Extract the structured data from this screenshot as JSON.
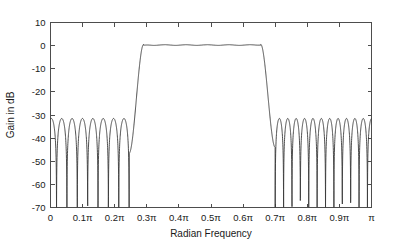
{
  "figure": {
    "background_color": "#ffffff",
    "axes_color": "#4d4d4d",
    "line_color": "#3a3a3a"
  },
  "chart_data": {
    "type": "line",
    "title": "",
    "subtitle": "",
    "xlabel": "Radian Frequency",
    "ylabel": "Gain in dB",
    "xlim": [
      0,
      1
    ],
    "ylim": [
      -70,
      10
    ],
    "grid": false,
    "legend": null,
    "annotations": [],
    "xtick_values": [
      0,
      0.1,
      0.2,
      0.3,
      0.4,
      0.5,
      0.6,
      0.7,
      0.8,
      0.9,
      1
    ],
    "xtick_labels": [
      "0",
      "0.1π",
      "0.2π",
      "0.3π",
      "0.4π",
      "0.5π",
      "0.6π",
      "0.7π",
      "0.8π",
      "0.9π",
      "π"
    ],
    "ytick_values": [
      10,
      0,
      -10,
      -20,
      -30,
      -40,
      -50,
      -60,
      -70
    ],
    "ytick_labels": [
      "10",
      "0",
      "-10",
      "-20",
      "-30",
      "-40",
      "-50",
      "-60",
      "-70"
    ],
    "series": [
      {
        "name": "Magnitude response",
        "description": "Equiripple bandpass FIR filter magnitude response in dB",
        "filter": {
          "type": "bandpass",
          "passband_edges_pi": [
            0.29,
            0.655
          ],
          "stopband_edges_pi": [
            0.245,
            0.7
          ],
          "passband_ripple_db": 0.6,
          "stopband_attenuation_db": -31.5,
          "transition_width_pi": 0.045,
          "left_stopband_lobe_count": 8,
          "right_stopband_lobe_count": 12
        },
        "key_points": [
          {
            "x_pi": 0.0,
            "y_db": -31.8
          },
          {
            "x_pi": 0.017,
            "y_db": -62.5
          },
          {
            "x_pi": 0.04,
            "y_db": -32.5
          },
          {
            "x_pi": 0.062,
            "y_db": -60.0
          },
          {
            "x_pi": 0.085,
            "y_db": -32.2
          },
          {
            "x_pi": 0.108,
            "y_db": -53.0
          },
          {
            "x_pi": 0.13,
            "y_db": -32.0
          },
          {
            "x_pi": 0.152,
            "y_db": -61.5
          },
          {
            "x_pi": 0.175,
            "y_db": -31.9
          },
          {
            "x_pi": 0.198,
            "y_db": -62.0
          },
          {
            "x_pi": 0.218,
            "y_db": -31.8
          },
          {
            "x_pi": 0.236,
            "y_db": -70.0
          },
          {
            "x_pi": 0.245,
            "y_db": -46.5
          },
          {
            "x_pi": 0.29,
            "y_db": 0.5
          },
          {
            "x_pi": 0.35,
            "y_db": 0.55
          },
          {
            "x_pi": 0.42,
            "y_db": 0.45
          },
          {
            "x_pi": 0.5,
            "y_db": 0.55
          },
          {
            "x_pi": 0.58,
            "y_db": 0.45
          },
          {
            "x_pi": 0.645,
            "y_db": 0.5
          },
          {
            "x_pi": 0.695,
            "y_db": -30.0
          },
          {
            "x_pi": 0.705,
            "y_db": -61.5
          },
          {
            "x_pi": 0.722,
            "y_db": -31.5
          },
          {
            "x_pi": 0.742,
            "y_db": -55.0
          },
          {
            "x_pi": 0.762,
            "y_db": -31.6
          },
          {
            "x_pi": 0.781,
            "y_db": -70.0
          },
          {
            "x_pi": 0.8,
            "y_db": -31.7
          },
          {
            "x_pi": 0.82,
            "y_db": -55.0
          },
          {
            "x_pi": 0.84,
            "y_db": -31.8
          },
          {
            "x_pi": 0.86,
            "y_db": -55.5
          },
          {
            "x_pi": 0.88,
            "y_db": -31.8
          },
          {
            "x_pi": 0.9,
            "y_db": -56.0
          },
          {
            "x_pi": 0.92,
            "y_db": -31.8
          },
          {
            "x_pi": 0.94,
            "y_db": -53.0
          },
          {
            "x_pi": 0.96,
            "y_db": -31.7
          },
          {
            "x_pi": 0.98,
            "y_db": -52.5
          },
          {
            "x_pi": 1.0,
            "y_db": -31.5
          }
        ]
      }
    ]
  }
}
